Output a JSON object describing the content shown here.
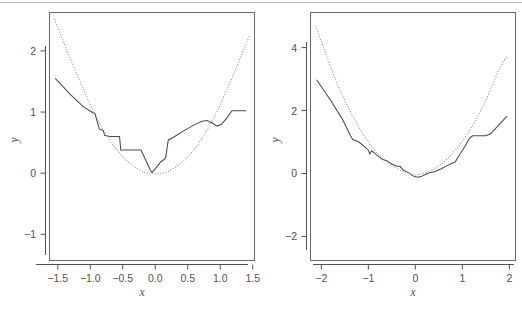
{
  "figure": {
    "width": 522,
    "height": 311,
    "background": "#ffffff",
    "page_rule_color": "#b9b9b9",
    "frame_color": "#666666",
    "axis_color": "#515151",
    "solid_line_color": "#4a4a4a",
    "dotted_line_color": "#8d8d8d",
    "panel_count": 2
  },
  "chart_data": [
    {
      "type": "line",
      "panel": "left",
      "title": "",
      "xlabel": "x",
      "ylabel": "y",
      "xlim": [
        -1.62,
        1.52
      ],
      "ylim": [
        -1.42,
        2.62
      ],
      "xticks": [
        -1.5,
        -1.0,
        -0.5,
        0.0,
        0.5,
        1.0,
        1.5
      ],
      "xtick_labels": [
        "-1.5",
        "-1.0",
        "-0.5",
        "0.0",
        "0.5",
        "1.0",
        "1.5"
      ],
      "yticks": [
        -1,
        0,
        1,
        2
      ],
      "ytick_labels": [
        "-1",
        "0",
        "1",
        "2"
      ],
      "grid": false,
      "legend": "none",
      "series": [
        {
          "name": "fitted-step-curve",
          "style": "solid",
          "color": "#4a4a4a",
          "x": [
            -1.54,
            -1.3,
            -1.1,
            -0.96,
            -0.93,
            -0.86,
            -0.8,
            -0.78,
            -0.7,
            -0.62,
            -0.55,
            -0.53,
            -0.4,
            -0.3,
            -0.22,
            -0.14,
            -0.08,
            -0.05,
            0.02,
            0.08,
            0.13,
            0.16,
            0.2,
            0.3,
            0.45,
            0.6,
            0.72,
            0.8,
            0.88,
            0.95,
            1.02,
            1.1,
            1.18,
            1.25,
            1.4
          ],
          "y": [
            1.55,
            1.28,
            1.08,
            0.99,
            0.98,
            0.72,
            0.7,
            0.62,
            0.6,
            0.6,
            0.6,
            0.38,
            0.38,
            0.38,
            0.38,
            0.2,
            0.06,
            0.01,
            0.1,
            0.18,
            0.22,
            0.25,
            0.54,
            0.6,
            0.7,
            0.79,
            0.85,
            0.86,
            0.82,
            0.77,
            0.8,
            0.9,
            1.02,
            1.02,
            1.02
          ]
        },
        {
          "name": "true-quadratic",
          "style": "dotted",
          "color": "#8d8d8d",
          "x": [
            -1.55,
            -1.4,
            -1.25,
            -1.1,
            -0.95,
            -0.8,
            -0.65,
            -0.5,
            -0.35,
            -0.2,
            -0.1,
            0.0,
            0.1,
            0.2,
            0.35,
            0.5,
            0.65,
            0.8,
            0.95,
            1.1,
            1.25,
            1.4,
            1.45
          ],
          "y": [
            2.52,
            2.12,
            1.73,
            1.36,
            1.01,
            0.71,
            0.46,
            0.27,
            0.13,
            0.03,
            0.0,
            -0.01,
            0.0,
            0.03,
            0.13,
            0.27,
            0.46,
            0.71,
            1.01,
            1.36,
            1.73,
            2.12,
            2.25
          ]
        }
      ]
    },
    {
      "type": "line",
      "panel": "right",
      "title": "",
      "xlabel": "x",
      "ylabel": "y",
      "xlim": [
        -2.22,
        2.12
      ],
      "ylim": [
        -2.75,
        5.1
      ],
      "xticks": [
        -2,
        -1,
        0,
        1,
        2
      ],
      "xtick_labels": [
        "-2",
        "-1",
        "0",
        "1",
        "2"
      ],
      "yticks": [
        -2,
        0,
        2,
        4
      ],
      "ytick_labels": [
        "-2",
        "0",
        "2",
        "4"
      ],
      "grid": false,
      "legend": "none",
      "series": [
        {
          "name": "fitted-step-curve",
          "style": "solid",
          "color": "#4a4a4a",
          "x": [
            -2.1,
            -1.8,
            -1.55,
            -1.38,
            -1.33,
            -1.2,
            -1.1,
            -1.0,
            -0.97,
            -0.93,
            -0.88,
            -0.8,
            -0.7,
            -0.6,
            -0.5,
            -0.4,
            -0.32,
            -0.25,
            -0.18,
            -0.1,
            -0.02,
            0.05,
            0.12,
            0.2,
            0.3,
            0.42,
            0.55,
            0.68,
            0.8,
            0.84,
            0.95,
            1.05,
            1.15,
            1.22,
            1.5,
            1.6,
            1.95
          ],
          "y": [
            2.98,
            2.32,
            1.72,
            1.2,
            1.08,
            1.0,
            0.88,
            0.74,
            0.62,
            0.72,
            0.66,
            0.56,
            0.45,
            0.4,
            0.3,
            0.24,
            0.22,
            0.1,
            0.05,
            -0.02,
            -0.1,
            -0.12,
            -0.1,
            -0.04,
            0.02,
            0.06,
            0.15,
            0.25,
            0.34,
            0.35,
            0.62,
            0.85,
            1.12,
            1.2,
            1.2,
            1.26,
            1.82
          ]
        },
        {
          "name": "true-quadratic",
          "style": "dotted",
          "color": "#8d8d8d",
          "x": [
            -2.12,
            -1.95,
            -1.8,
            -1.6,
            -1.4,
            -1.2,
            -1.0,
            -0.85,
            -0.7,
            -0.55,
            -0.4,
            -0.25,
            -0.12,
            0.0,
            0.12,
            0.25,
            0.4,
            0.55,
            0.7,
            0.85,
            1.0,
            1.2,
            1.4,
            1.6,
            1.8,
            1.95
          ],
          "y": [
            4.68,
            4.0,
            3.38,
            2.64,
            2.02,
            1.47,
            1.0,
            0.72,
            0.49,
            0.31,
            0.17,
            0.06,
            0.0,
            -0.05,
            -0.02,
            0.04,
            0.14,
            0.3,
            0.5,
            0.74,
            1.03,
            1.48,
            2.03,
            2.66,
            3.38,
            3.72
          ]
        }
      ]
    }
  ],
  "panels": {
    "left": {
      "name": "left-plot",
      "xlabel": "x",
      "ylabel": "y",
      "xtick_labels": [
        "-1.5",
        "-1.0",
        "-0.5",
        "0.0",
        "0.5",
        "1.0",
        "1.5"
      ],
      "ytick_labels": [
        "-1",
        "0",
        "1",
        "2"
      ]
    },
    "right": {
      "name": "right-plot",
      "xlabel": "x",
      "ylabel": "y",
      "xtick_labels": [
        "-2",
        "-1",
        "0",
        "1",
        "2"
      ],
      "ytick_labels": [
        "-2",
        "0",
        "2",
        "4"
      ]
    }
  }
}
